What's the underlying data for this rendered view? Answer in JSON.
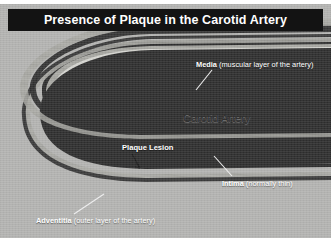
{
  "figure": {
    "title": "Presence of Plaque in the Carotid Artery",
    "background_color": "#b3b3b1",
    "banner_color": "#131313",
    "banner_text_color": "#ffffff"
  },
  "labels": {
    "media": {
      "lead": "Media ",
      "sub": "(muscular layer of the artery)"
    },
    "intima": {
      "lead": "Intima ",
      "sub": "(normally thin)"
    },
    "adventitia": {
      "lead": "Adventitia ",
      "sub": "(outer layer of the artery)"
    },
    "plaque": {
      "lead": "Plaque Lesion",
      "sub": ""
    },
    "carotid_artery": {
      "lead": "Carotid Artery",
      "sub": ""
    }
  },
  "anatomy": {
    "vessel_wall_dark": "#2b2b2b",
    "intima_line": "#d8d8d4",
    "lumen_fill": "#a9a9a5",
    "plaque_fill": "#8f8f8a",
    "adventitia_fill": "#9e9e9a",
    "leader_line_color": "#f2f2f2"
  }
}
